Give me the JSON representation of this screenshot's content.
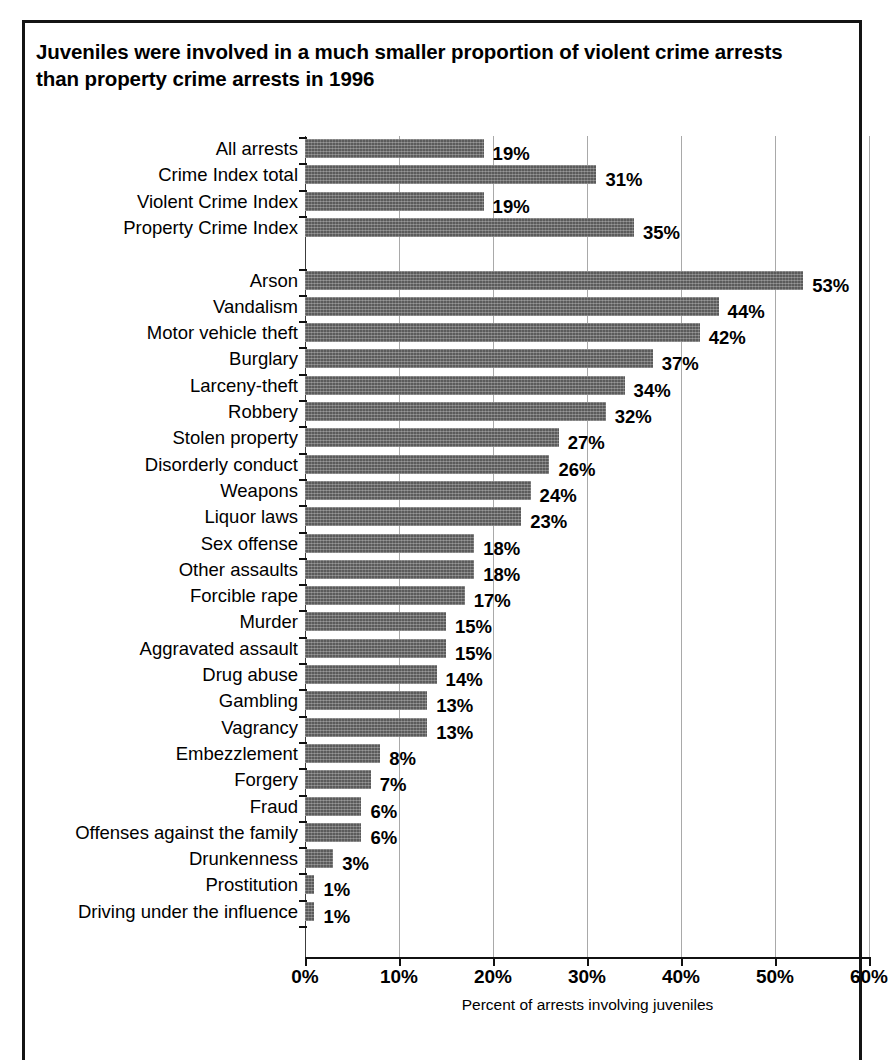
{
  "chart_data": {
    "type": "bar",
    "orientation": "horizontal",
    "title": "Juveniles were involved in a much smaller proportion of violent crime arrests than property crime arrests in 1996",
    "xlabel": "Percent of arrests involving juveniles",
    "ylabel": "",
    "xlim": [
      0,
      60
    ],
    "xticks": [
      0,
      10,
      20,
      30,
      40,
      50,
      60
    ],
    "xtick_labels": [
      "0%",
      "10%",
      "20%",
      "30%",
      "40%",
      "50%",
      "60%"
    ],
    "grid": "vertical",
    "legend": "none",
    "value_label_suffix": "%",
    "bar_color": "#5b5b5b",
    "categories": [
      "All arrests",
      "Crime Index total",
      "Violent Crime Index",
      "Property Crime Index",
      "Arson",
      "Vandalism",
      "Motor vehicle theft",
      "Burglary",
      "Larceny-theft",
      "Robbery",
      "Stolen property",
      "Disorderly conduct",
      "Weapons",
      "Liquor laws",
      "Sex offense",
      "Other assaults",
      "Forcible rape",
      "Murder",
      "Aggravated assault",
      "Drug abuse",
      "Gambling",
      "Vagrancy",
      "Embezzlement",
      "Forgery",
      "Fraud",
      "Offenses against the family",
      "Drunkenness",
      "Prostitution",
      "Driving under the influence"
    ],
    "values": [
      19,
      31,
      19,
      35,
      53,
      44,
      42,
      37,
      34,
      32,
      27,
      26,
      24,
      23,
      18,
      18,
      17,
      15,
      15,
      14,
      13,
      13,
      8,
      7,
      6,
      6,
      3,
      1,
      1
    ],
    "value_labels": [
      "19%",
      "31%",
      "19%",
      "35%",
      "53%",
      "44%",
      "42%",
      "37%",
      "34%",
      "32%",
      "27%",
      "26%",
      "24%",
      "23%",
      "18%",
      "18%",
      "17%",
      "15%",
      "15%",
      "14%",
      "13%",
      "13%",
      "8%",
      "7%",
      "6%",
      "6%",
      "3%",
      "1%",
      "1%"
    ],
    "group_break_after_index": 3
  }
}
